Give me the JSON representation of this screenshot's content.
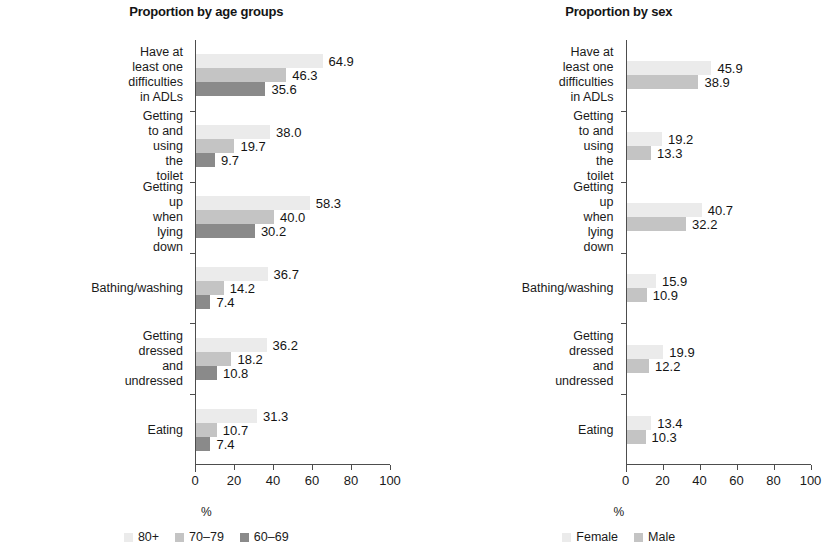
{
  "figure": {
    "panels": [
      {
        "id": "age-groups",
        "title": "Proportion by age groups",
        "axis_caption": "%"
      },
      {
        "id": "sex",
        "title": "Proportion by sex",
        "axis_caption": "%"
      }
    ]
  },
  "chart_data": [
    {
      "type": "bar",
      "orientation": "horizontal",
      "title": "Proportion by age groups",
      "xlabel": "%",
      "ylabel": "",
      "xlim": [
        0,
        100
      ],
      "xticks": [
        0,
        20,
        40,
        60,
        80,
        100
      ],
      "xtick_labels": [
        "0",
        "20",
        "40",
        "60",
        "80",
        "100"
      ],
      "grid": false,
      "legend_position": "bottom",
      "categories": [
        "Have at least one difficulties\nin ADLs",
        "Getting to and using the\ntoilet",
        "Getting up when lying\ndown",
        "Bathing/washing",
        "Getting dressed and\nundressed",
        "Eating"
      ],
      "series": [
        {
          "name": "80+",
          "color": "#ebebeb",
          "values": [
            64.9,
            38.0,
            58.3,
            36.7,
            36.2,
            31.3
          ],
          "labels": [
            "64.9",
            "38.0",
            "58.3",
            "36.7",
            "36.2",
            "31.3"
          ]
        },
        {
          "name": "70–79",
          "color": "#c4c4c4",
          "values": [
            46.3,
            19.7,
            40.0,
            14.2,
            18.2,
            10.7
          ],
          "labels": [
            "46.3",
            "19.7",
            "40.0",
            "14.2",
            "18.2",
            "10.7"
          ]
        },
        {
          "name": "60–69",
          "color": "#8a8a8a",
          "values": [
            35.6,
            9.7,
            30.2,
            7.4,
            10.8,
            7.4
          ],
          "labels": [
            "35.6",
            "9.7",
            "30.2",
            "7.4",
            "10.8",
            "7.4"
          ]
        }
      ]
    },
    {
      "type": "bar",
      "orientation": "horizontal",
      "title": "Proportion by sex",
      "xlabel": "%",
      "ylabel": "",
      "xlim": [
        0,
        100
      ],
      "xticks": [
        0,
        20,
        40,
        60,
        80,
        100
      ],
      "xtick_labels": [
        "0",
        "20",
        "40",
        "60",
        "80",
        "100"
      ],
      "grid": false,
      "legend_position": "bottom",
      "categories": [
        "Have at least one difficulties\nin ADLs",
        "Getting to and using the\ntoilet",
        "Getting up when lying down",
        "Bathing/washing",
        "Getting dressed and\nundressed",
        "Eating"
      ],
      "series": [
        {
          "name": "Female",
          "color": "#ebebeb",
          "values": [
            45.9,
            19.2,
            40.7,
            15.9,
            19.9,
            13.4
          ],
          "labels": [
            "45.9",
            "19.2",
            "40.7",
            "15.9",
            "19.9",
            "13.4"
          ]
        },
        {
          "name": "Male",
          "color": "#c4c4c4",
          "values": [
            38.9,
            13.3,
            32.2,
            10.9,
            12.2,
            10.3
          ],
          "labels": [
            "38.9",
            "13.3",
            "32.2",
            "10.9",
            "12.2",
            "10.3"
          ]
        }
      ]
    }
  ]
}
